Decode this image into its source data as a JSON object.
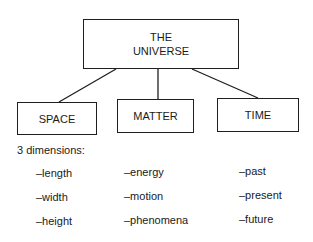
{
  "root": {
    "line1": "THE",
    "line2": "UNIVERSE"
  },
  "children": [
    {
      "label": "SPACE"
    },
    {
      "label": "MATTER"
    },
    {
      "label": "TIME"
    }
  ],
  "note": "3 dimensions:",
  "columns": [
    [
      "–length",
      "–width",
      "–height"
    ],
    [
      "–energy",
      "–motion",
      "–phenomena"
    ],
    [
      "–past",
      "–present",
      "–future"
    ]
  ]
}
